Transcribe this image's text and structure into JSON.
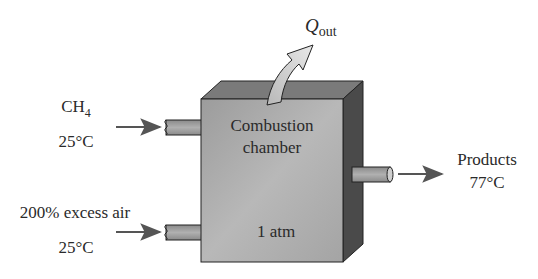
{
  "diagram": {
    "type": "process-flow",
    "chamber": {
      "label_line1": "Combustion",
      "label_line2": "chamber",
      "pressure": "1 atm"
    },
    "heat_output": {
      "symbol": "Q",
      "subscript": "out"
    },
    "inlets": [
      {
        "species": "CH",
        "subscript": "4",
        "temperature": "25°C"
      },
      {
        "species": "200% excess air",
        "temperature": "25°C"
      }
    ],
    "outlet": {
      "label": "Products",
      "temperature": "77°C"
    },
    "colors": {
      "front_face": "#a8a8a8",
      "top_face": "#7a7a7a",
      "side_face": "#4a4a4a",
      "pipe": "#9a9a9a",
      "arrow": "#555555",
      "heat_arrow": "#d8d8d8",
      "text": "#2a2a2a"
    }
  }
}
